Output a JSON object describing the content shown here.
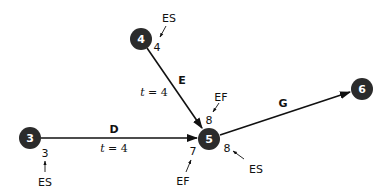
{
  "diagram": {
    "type": "activity-on-arrow network",
    "nodes": [
      {
        "id": "3",
        "label": "3"
      },
      {
        "id": "4",
        "label": "4"
      },
      {
        "id": "5",
        "label": "5"
      },
      {
        "id": "6",
        "label": "6"
      }
    ],
    "edges": [
      {
        "from": "3",
        "to": "5",
        "activity": "D",
        "duration_prefix": "t",
        "duration_text": " = 4"
      },
      {
        "from": "4",
        "to": "5",
        "activity": "E",
        "duration_prefix": "t",
        "duration_text": " = 4"
      },
      {
        "from": "5",
        "to": "6",
        "activity": "G"
      }
    ],
    "annotations": {
      "node3_es_value": "3",
      "node3_es_tag": "ES",
      "node4_es_value": "4",
      "node4_es_tag": "ES",
      "edgeE_ef_value": "8",
      "edgeE_ef_tag": "EF",
      "edgeD_ef_value": "7",
      "edgeD_ef_tag": "EF",
      "node5_es_value": "8",
      "node5_es_tag": "ES"
    },
    "colors": {
      "node_fill": "#2b2b2b",
      "node_text": "#ffffff",
      "line": "#111111"
    }
  }
}
